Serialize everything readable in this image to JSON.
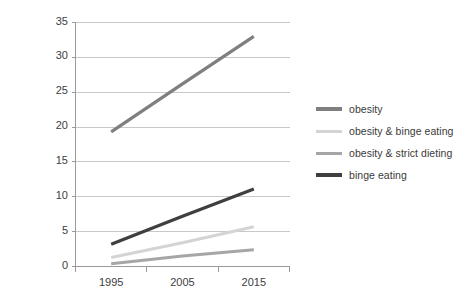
{
  "chart_data": {
    "type": "line",
    "title": "",
    "subtitle": "",
    "xlabel": "",
    "ylabel": "",
    "categories": [
      "1995",
      "2005",
      "2015"
    ],
    "series": [
      {
        "name": "obesity",
        "values": [
          19.3,
          26.2,
          33.0
        ],
        "color": "#7f7f7f",
        "width": 3.2
      },
      {
        "name": "obesity & binge eating",
        "values": [
          1.3,
          3.4,
          5.7
        ],
        "color": "#d4d4d4",
        "width": 3.0
      },
      {
        "name": "obesity & strict dieting",
        "values": [
          0.4,
          1.5,
          2.4
        ],
        "color": "#a6a6a6",
        "width": 3.0
      },
      {
        "name": "binge eating",
        "values": [
          3.2,
          7.2,
          11.1
        ],
        "color": "#3f3f3f",
        "width": 3.2
      }
    ],
    "ylim": [
      0,
      35
    ],
    "yticks": [
      0,
      5,
      10,
      15,
      20,
      25,
      30,
      35
    ],
    "ytick_labels": [
      "0",
      "5",
      "10",
      "15",
      "20",
      "25",
      "30",
      "35"
    ],
    "xtick_labels": [
      "1995",
      "2005",
      "2015"
    ],
    "grid": true,
    "grid_axis": "y",
    "grid_color": "#c8c8c8",
    "axis_color": "#9a9a9a",
    "legend_position": "right",
    "legend_entries": [
      "obesity",
      "obesity & binge eating",
      "obesity & strict dieting",
      "binge eating"
    ],
    "background_color": "#ffffff"
  }
}
